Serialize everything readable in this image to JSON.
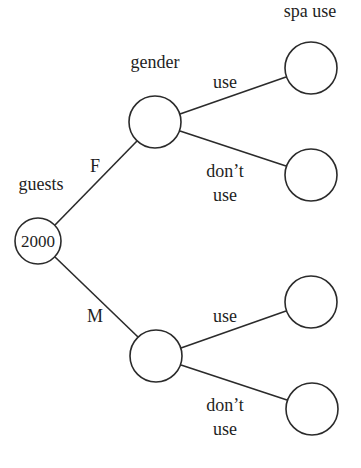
{
  "diagram": {
    "type": "tree-diagram",
    "column_headers": {
      "root": "guests",
      "level1": "gender",
      "level2": "spa use"
    },
    "root": {
      "id": "root",
      "value": "2000",
      "cx": 38,
      "cy": 241,
      "r": 23
    },
    "nodes": [
      {
        "id": "female",
        "value": "",
        "cx": 155,
        "cy": 122,
        "r": 26
      },
      {
        "id": "male",
        "value": "",
        "cx": 156,
        "cy": 356,
        "r": 26
      },
      {
        "id": "female-use",
        "value": "",
        "cx": 311,
        "cy": 68,
        "r": 26
      },
      {
        "id": "female-dont-use",
        "value": "",
        "cx": 311,
        "cy": 175,
        "r": 26
      },
      {
        "id": "male-use",
        "value": "",
        "cx": 311,
        "cy": 302,
        "r": 26
      },
      {
        "id": "male-dont-use",
        "value": "",
        "cx": 312,
        "cy": 409,
        "r": 26
      }
    ],
    "edges": [
      {
        "from": "root",
        "to": "female",
        "label": "F"
      },
      {
        "from": "root",
        "to": "male",
        "label": "M"
      },
      {
        "from": "female",
        "to": "female-use",
        "label": "use"
      },
      {
        "from": "female",
        "to": "female-dont-use",
        "label_line1": "don’t",
        "label_line2": "use"
      },
      {
        "from": "male",
        "to": "male-use",
        "label": "use"
      },
      {
        "from": "male",
        "to": "male-dont-use",
        "label_line1": "don’t",
        "label_line2": "use"
      }
    ]
  }
}
